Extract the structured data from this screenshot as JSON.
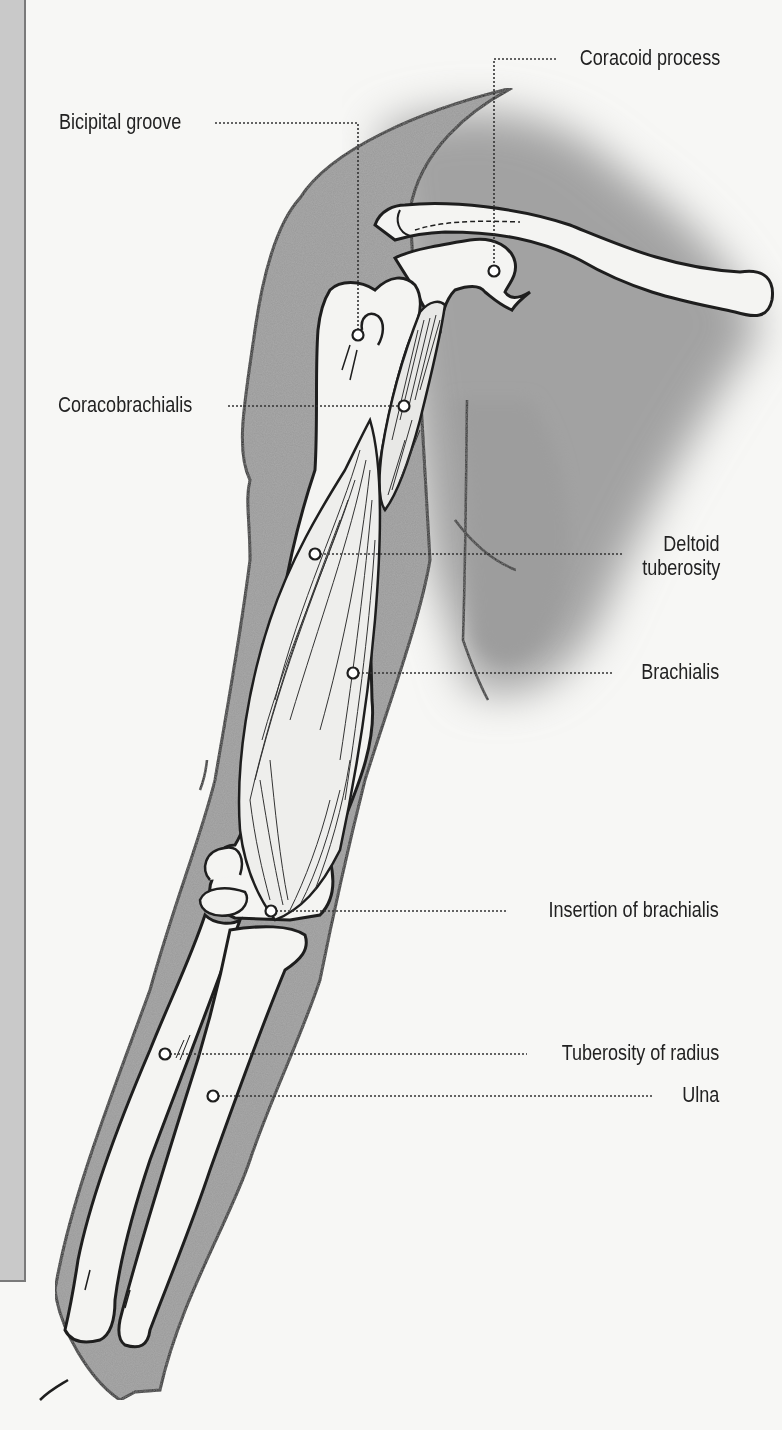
{
  "diagram": {
    "colors": {
      "background": "#f7f7f5",
      "skin_shadow": "#9a9a9a",
      "bone_fill": "#f4f4f2",
      "outline": "#1e1e1e",
      "leader_line": "#333333",
      "side_panel": "#c9c9c9"
    },
    "labels": [
      {
        "id": "coracoid-process",
        "text": "Coracoid process",
        "side": "right",
        "marker": [
          494,
          271
        ]
      },
      {
        "id": "bicipital-groove",
        "text": "Bicipital groove",
        "side": "left",
        "marker": [
          358,
          335
        ]
      },
      {
        "id": "coracobrachialis",
        "text": "Coracobrachialis",
        "side": "left",
        "marker": [
          404,
          406
        ]
      },
      {
        "id": "deltoid-tuberosity",
        "text": "Deltoid tuberosity",
        "lines": [
          "Deltoid",
          "tuberosity"
        ],
        "side": "right",
        "marker": [
          315,
          554
        ]
      },
      {
        "id": "brachialis",
        "text": "Brachialis",
        "side": "right",
        "marker": [
          353,
          673
        ]
      },
      {
        "id": "insertion-of-brachialis",
        "text": "Insertion of brachialis",
        "side": "right",
        "marker": [
          271,
          911
        ]
      },
      {
        "id": "tuberosity-of-radius",
        "text": "Tuberosity of radius",
        "side": "right",
        "marker": [
          165,
          1054
        ]
      },
      {
        "id": "ulna",
        "text": "Ulna",
        "side": "right",
        "marker": [
          213,
          1096
        ]
      }
    ]
  }
}
